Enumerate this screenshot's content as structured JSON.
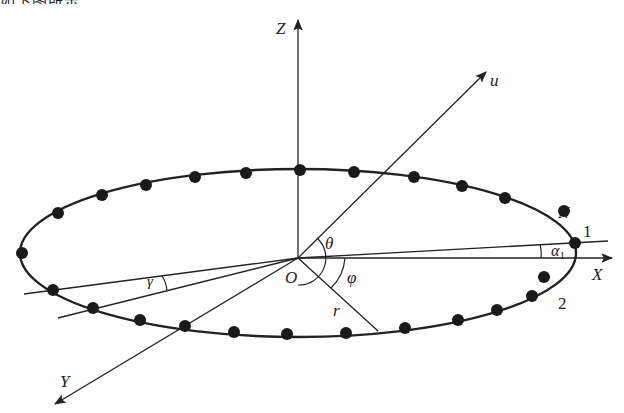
{
  "diagram": {
    "type": "circular-array-geometry",
    "top_text_fragment": "如下图所示。",
    "labels": {
      "z_axis": "Z",
      "x_axis": "X",
      "y_axis": "Y",
      "u_vector": "u",
      "origin": "O",
      "theta": "θ",
      "phi": "φ",
      "radius": "r",
      "gamma": "γ",
      "alpha": "α",
      "alpha_sub": "1",
      "element_n": "N",
      "element_1": "1",
      "element_2": "2"
    },
    "ellipse": {
      "cx": 298,
      "cy": 253,
      "rx": 278,
      "ry": 84
    },
    "element_count": 24,
    "colors": {
      "stroke": "#222222",
      "dot": "#1a1a1a",
      "background": "#ffffff"
    }
  }
}
